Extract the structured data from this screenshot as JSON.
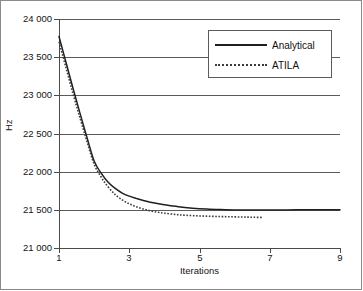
{
  "chart_data": {
    "type": "line",
    "title": "",
    "xlabel": "Iterations",
    "ylabel": "Hz",
    "xlim": [
      1,
      9
    ],
    "ylim": [
      21000,
      24000
    ],
    "grid": true,
    "legend_position": "top-right",
    "y_ticks": [
      21000,
      21500,
      22000,
      22500,
      23000,
      23500,
      24000
    ],
    "y_tick_labels": [
      "21 000",
      "21 500",
      "22 000",
      "22 500",
      "23 000",
      "23 500",
      "24 000"
    ],
    "x_ticks": [
      1,
      3,
      5,
      7,
      9
    ],
    "x_tick_labels": [
      "1",
      "3",
      "5",
      "7",
      "9"
    ],
    "series": [
      {
        "name": "Analytical",
        "style": "solid",
        "color": "#1f1f1f",
        "x": [
          1.0,
          1.2,
          1.4,
          1.6,
          1.8,
          2.0,
          2.2,
          2.4,
          2.6,
          2.8,
          3.0,
          3.2,
          3.4,
          3.6,
          3.8,
          4.0,
          4.4,
          4.8,
          5.2,
          5.6,
          6.0,
          6.5,
          7.0,
          7.5,
          8.0,
          8.5,
          9.0
        ],
        "values": [
          23770,
          23430,
          23090,
          22760,
          22440,
          22140,
          21980,
          21860,
          21780,
          21720,
          21680,
          21650,
          21622,
          21600,
          21582,
          21566,
          21540,
          21522,
          21510,
          21503,
          21499,
          21497,
          21498,
          21499,
          21500,
          21500,
          21500
        ]
      },
      {
        "name": "ATILA",
        "style": "dotted",
        "color": "#3d3d3d",
        "x": [
          1.0,
          1.2,
          1.4,
          1.6,
          1.8,
          2.0,
          2.2,
          2.4,
          2.6,
          2.8,
          3.0,
          3.2,
          3.4,
          3.6,
          3.8,
          4.0,
          4.3,
          4.6,
          5.0,
          5.4,
          5.8,
          6.2,
          6.5,
          6.8
        ],
        "values": [
          23700,
          23360,
          23020,
          22700,
          22390,
          22100,
          21930,
          21800,
          21700,
          21630,
          21578,
          21540,
          21510,
          21487,
          21470,
          21456,
          21440,
          21429,
          21420,
          21414,
          21410,
          21406,
          21403,
          21400
        ]
      }
    ]
  },
  "legend": {
    "items": [
      {
        "label": "Analytical"
      },
      {
        "label": "ATILA"
      }
    ]
  },
  "axes": {
    "x_title": "Iterations",
    "y_title": "Hz"
  }
}
